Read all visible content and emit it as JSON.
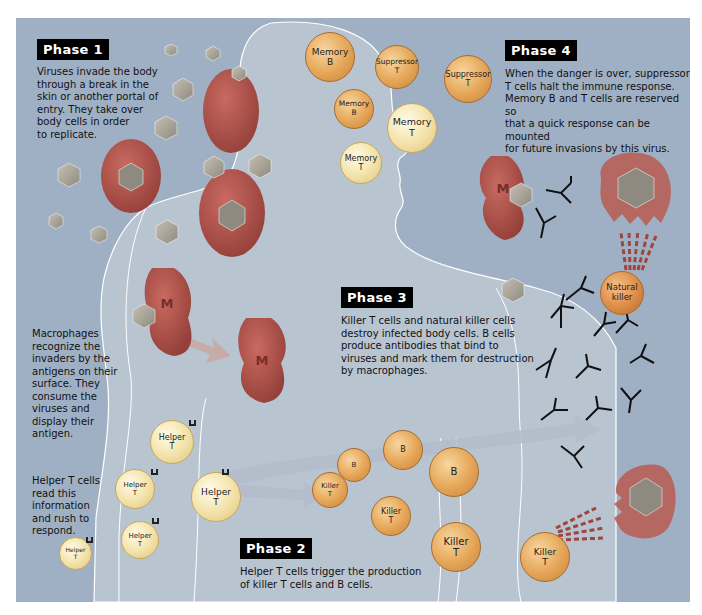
{
  "phases": [
    {
      "label": "Phase 1",
      "text": "Viruses invade the body\nthrough a break in the\nskin or another portal of\nentry. They take over\nbody cells in order\nto replicate."
    },
    {
      "label": "Phase 2",
      "text": "Helper T cells trigger the production\nof killer T cells and B cells."
    },
    {
      "label": "Phase 3",
      "text": "Killer T cells and natural killer cells\ndestroy infected body cells. B cells\nproduce antibodies that bind to\nviruses and mark them for destruction\nby macrophages."
    },
    {
      "label": "Phase 4",
      "text": "When the danger is over, suppressor\nT cells halt the immune response.\nMemory B and T cells are reserved so\nthat a quick response can be mounted\nfor future invasions by this virus."
    }
  ],
  "side_notes": {
    "macrophages": "Macrophages\nrecognize the\ninvaders by the\nantigens on their\nsurface. They\nconsume the\nviruses and\ndisplay their\nantigen.",
    "helper": "Helper T cells\nread this\ninformation\nand rush to\nrespond."
  },
  "cells": {
    "memory_b_1": "Memory\nB",
    "suppressor_t_1": "Suppressor\nT",
    "suppressor_t_2": "Suppressor\nT",
    "memory_b_2": "Memory\nB",
    "memory_t_1": "Memory\nT",
    "memory_t_2": "Memory\nT",
    "natural_killer": "Natural\nkiller",
    "helper_1": "Helper\nT",
    "helper_2": "Helper\nT",
    "helper_3": "Helper\nT",
    "helper_4": "Helper\nT",
    "helper_5": "Helper\nT",
    "b_1": "B",
    "b_2": "B",
    "b_3": "B",
    "killer_1": "Killer\nT",
    "killer_2": "Killer\nT",
    "killer_3": "Killer\nT",
    "killer_4": "Killer\nT",
    "macrophage_label": "M"
  },
  "colors": {
    "background": "#9fb0c4",
    "body": "#b9c4d1",
    "body_outline": "#ffffff",
    "macrophage": "#b5504a",
    "infected_cell": "#b85a50",
    "virus": "#a9a49a",
    "arrow": "#c9a7a0"
  }
}
